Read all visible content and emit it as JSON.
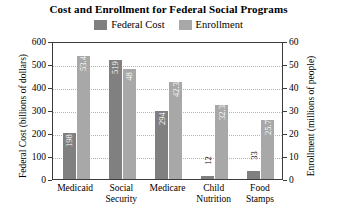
{
  "chart_data": {
    "type": "bar",
    "title": "Cost and Enrollment for Federal Social Programs",
    "categories": [
      "Medicaid",
      "Social Security",
      "Medicare",
      "Child Nutrition",
      "Food Stamps"
    ],
    "series": [
      {
        "name": "Federal Cost",
        "axis": "left",
        "color": "#808080",
        "values": [
          198,
          519,
          294,
          12,
          33
        ],
        "value_labels": [
          "198",
          "519",
          "294",
          "12",
          "33"
        ]
      },
      {
        "name": "Enrollment",
        "axis": "right",
        "color": "#a8a8a8",
        "values": [
          53.4,
          48,
          42.3,
          32.3,
          25.7
        ],
        "value_labels": [
          "53.4",
          "48",
          "42.3",
          "32.3",
          "25.7"
        ]
      }
    ],
    "xlabel": "",
    "ylabel": "Federal Cost (billions of dollars)",
    "y2label": "Enrollment (millions of people)",
    "ylim": [
      0,
      600
    ],
    "y2lim": [
      0,
      60
    ],
    "yticks": [
      "0",
      "100",
      "200",
      "300",
      "400",
      "500",
      "600"
    ],
    "y2ticks": [
      "0",
      "10",
      "20",
      "30",
      "40",
      "50",
      "60"
    ],
    "grid": true,
    "legend_position": "top"
  },
  "legend": {
    "entries": [
      {
        "label": "Federal Cost",
        "color": "#808080"
      },
      {
        "label": "Enrollment",
        "color": "#a8a8a8"
      }
    ]
  },
  "categories_wrapped": [
    {
      "line1": "Medicaid",
      "line2": ""
    },
    {
      "line1": "Social",
      "line2": "Security"
    },
    {
      "line1": "Medicare",
      "line2": ""
    },
    {
      "line1": "Child",
      "line2": "Nutrition"
    },
    {
      "line1": "Food",
      "line2": "Stamps"
    }
  ]
}
